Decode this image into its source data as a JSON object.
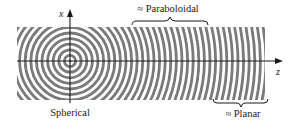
{
  "figure": {
    "axes": {
      "vertical_label": "x",
      "horizontal_label": "z"
    },
    "regions": [
      {
        "id": "spherical",
        "label": "Spherical",
        "position": "below source"
      },
      {
        "id": "paraboloidal",
        "label": "≈ Paraboloidal",
        "position": "top, middle distance"
      },
      {
        "id": "planar",
        "label": "≈ Planar",
        "position": "bottom right, far distance"
      }
    ],
    "wave": {
      "source": {
        "x": 70,
        "y": 61
      },
      "ring_spacing_px": 5.6,
      "ring_count": 36,
      "band": {
        "left": 17,
        "right": 265,
        "top": 27,
        "bottom": 100
      }
    },
    "colors": {
      "rings": "#7a7a7a",
      "axes": "#1a1a1a",
      "text": "#1a1a1a",
      "background": "#ffffff"
    }
  }
}
